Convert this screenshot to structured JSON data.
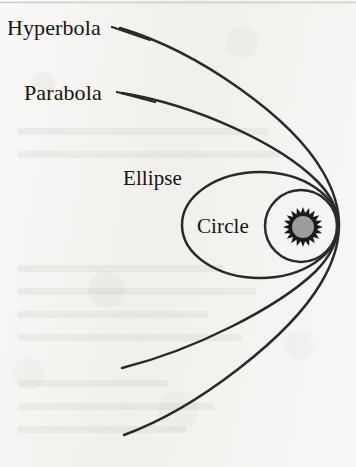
{
  "figure": {
    "background_color": "#f3f2ef",
    "ink_color": "#2b2a29",
    "labels": {
      "hyperbola": "Hyperbola",
      "parabola": "Parabola",
      "ellipse": "Ellipse",
      "circle": "Circle"
    },
    "sun": {
      "name": "sun-symbol",
      "center_x": 303,
      "center_y": 227,
      "disc_radius": 13,
      "ray_count": 20,
      "disc_color": "#9c9c9c",
      "ring_color": "#1a1a1a"
    },
    "curves": [
      {
        "name": "circle",
        "type": "circle",
        "center_x": 301,
        "center_y": 226,
        "radius": 36,
        "eccentricity": 0
      },
      {
        "name": "ellipse",
        "type": "ellipse",
        "center_x": 260,
        "center_y": 225,
        "semi_major": 78,
        "semi_minor": 53,
        "eccentricity": 0.73
      },
      {
        "name": "parabola",
        "type": "parabola",
        "vertex_x": 338,
        "vertex_y": 225,
        "eccentricity": 1,
        "endpoint_upper": [
          122,
          93
        ],
        "endpoint_lower": [
          122,
          368
        ]
      },
      {
        "name": "hyperbola",
        "type": "hyperbola",
        "vertex_x": 339,
        "vertex_y": 225,
        "eccentricity": 1.6,
        "endpoint_upper": [
          120,
          28
        ],
        "endpoint_lower": [
          124,
          435
        ]
      }
    ],
    "leader_lines": [
      {
        "name": "leader-hyperbola",
        "x1": 112,
        "y1": 27,
        "x2": 150,
        "y2": 40
      },
      {
        "name": "leader-parabola",
        "x1": 117,
        "y1": 92,
        "x2": 155,
        "y2": 102
      }
    ],
    "focus_point": {
      "x": 338,
      "y": 225
    },
    "border": {
      "top_rule": true,
      "color": "#cfcdc8"
    }
  }
}
